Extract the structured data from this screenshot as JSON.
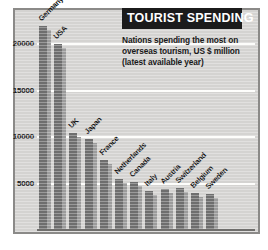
{
  "chart_data": {
    "type": "bar",
    "title": "TOURIST SPENDING",
    "subtitle": "Nations spending the most on overseas tourism, US $ million (latest available year)",
    "xlabel": "",
    "ylabel": "",
    "ylim": [
      0,
      23500
    ],
    "yticks": [
      5000,
      10000,
      15000,
      20000
    ],
    "ytick_labels": [
      "5000",
      "10000",
      "15000",
      "20000"
    ],
    "grid": true,
    "legend": false,
    "categories": [
      "Germany",
      "USA",
      "UK",
      "Japan",
      "France",
      "Netherlands",
      "Canada",
      "Italy",
      "Austria",
      "Switzerland",
      "Belgium",
      "Sweden"
    ],
    "values": [
      22000,
      20000,
      10500,
      9800,
      7500,
      5500,
      5200,
      4200,
      4400,
      4500,
      4000,
      3900
    ]
  },
  "chart": {
    "bars": [
      {
        "label": "Germany",
        "value": 22000
      },
      {
        "label": "USA",
        "value": 20000
      },
      {
        "label": "UK",
        "value": 10500
      },
      {
        "label": "Japan",
        "value": 9800
      },
      {
        "label": "France",
        "value": 7500
      },
      {
        "label": "Netherlands",
        "value": 5500
      },
      {
        "label": "Canada",
        "value": 5200
      },
      {
        "label": "Italy",
        "value": 4200
      },
      {
        "label": "Austria",
        "value": 4400
      },
      {
        "label": "Switzerland",
        "value": 4500
      },
      {
        "label": "Belgium",
        "value": 4000
      },
      {
        "label": "Sweden",
        "value": 3900
      }
    ],
    "yticks": [
      {
        "value": 20000,
        "label": "20000"
      },
      {
        "value": 15000,
        "label": "15000"
      },
      {
        "value": 10000,
        "label": "10000"
      },
      {
        "value": 5000,
        "label": "5000"
      }
    ],
    "title": "TOURIST SPENDING",
    "subtitle_lines": [
      "Nations spending the most on",
      "overseas tourism, US $ million",
      "(latest available year)"
    ]
  },
  "colors": {
    "bar_front": "#6e6e6e",
    "bar_side": "#9b9b9b",
    "plate_background": "#d4d3d1",
    "frame": "#8b8a88",
    "gridline": "#fdfdfb",
    "title_background": "#1b1b1b",
    "title_text": "#ffffff",
    "text": "#1a1a1a"
  }
}
